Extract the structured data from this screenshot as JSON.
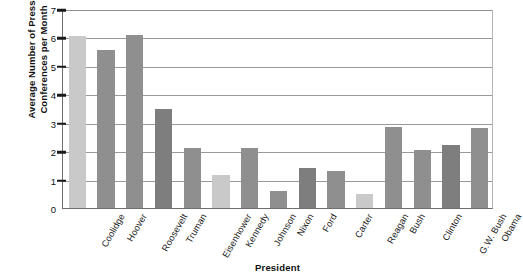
{
  "chart_data": {
    "type": "bar",
    "title": "",
    "xlabel": "President",
    "ylabel": "Average Number of Press Conferences per Month",
    "ylabel_lines": [
      "Average Number of Press",
      "Conferences per Month"
    ],
    "categories": [
      "Coolidge",
      "Hoover",
      "Roosevelt",
      "Truman",
      "Eisenhower",
      "Kennedy",
      "Johnson",
      "Nixon",
      "Ford",
      "Carter",
      "Reagan",
      "Bush",
      "Clinton",
      "G.W. Bush",
      "Obama"
    ],
    "values": [
      6.05,
      5.55,
      6.1,
      3.5,
      2.1,
      1.15,
      2.1,
      0.6,
      1.4,
      1.3,
      0.5,
      2.85,
      2.05,
      2.2,
      2.8
    ],
    "bar_colors": [
      "#c9c9c9",
      "#8f8f8f",
      "#8f8f8f",
      "#7e7e7e",
      "#8f8f8f",
      "#c9c9c9",
      "#8f8f8f",
      "#8f8f8f",
      "#7e7e7e",
      "#8f8f8f",
      "#c9c9c9",
      "#8f8f8f",
      "#8f8f8f",
      "#7e7e7e",
      "#8f8f8f"
    ],
    "ylim": [
      0,
      7
    ],
    "ytick_labels": [
      "0",
      "1",
      "2",
      "3",
      "4",
      "5",
      "6",
      "7"
    ],
    "ytick_values": [
      0,
      1,
      2,
      3,
      4,
      5,
      6,
      7
    ],
    "grid": true,
    "grid_axis": "y",
    "legend": null,
    "xtick_rotation_deg": -60,
    "grid_color": "#9a9a9a",
    "axis_color": "#6f6f6f",
    "text_color": "#111111",
    "background": "#ffffff"
  }
}
